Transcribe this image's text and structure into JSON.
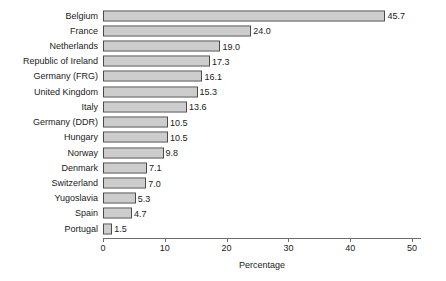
{
  "chart_data": {
    "type": "bar",
    "orientation": "horizontal",
    "title": "",
    "subtitle": "",
    "xlabel": "Percentage",
    "ylabel": "",
    "xlim": [
      0,
      51.5
    ],
    "xticks": [
      0,
      10,
      20,
      30,
      40,
      50
    ],
    "xtick_labels": [
      "0",
      "10",
      "20",
      "30",
      "40",
      "50"
    ],
    "grid": false,
    "legend": null,
    "categories": [
      "Belgium",
      "France",
      "Netherlands",
      "Republic of Ireland",
      "Germany (FRG)",
      "United Kingdom",
      "Italy",
      "Germany (DDR)",
      "Hungary",
      "Norway",
      "Denmark",
      "Switzerland",
      "Yugoslavia",
      "Spain",
      "Portugal"
    ],
    "values": [
      45.7,
      24.0,
      19.0,
      17.3,
      16.1,
      15.3,
      13.6,
      10.5,
      10.5,
      9.8,
      7.1,
      7.0,
      5.3,
      4.7,
      1.5
    ],
    "value_labels": [
      "45.7",
      "24.0",
      "19.0",
      "17.3",
      "16.1",
      "15.3",
      "13.6",
      "10.5",
      "10.5",
      "9.8",
      "7.1",
      "7.0",
      "5.3",
      "4.7",
      "1.5"
    ],
    "bar_fill": "#9a9a9a",
    "bar_border": "#4a4a4a",
    "axis_color": "#6b6b6b",
    "text_color": "#1a1a1a",
    "background": "#ffffff"
  }
}
